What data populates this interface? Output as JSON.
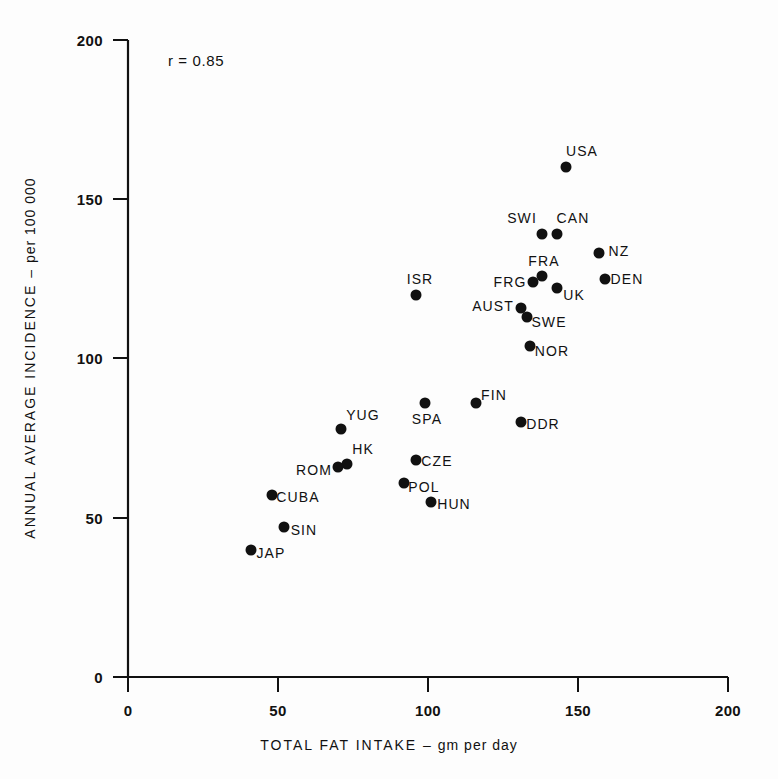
{
  "chart_data": {
    "type": "scatter",
    "title": "",
    "xlabel": "TOTAL FAT INTAKE",
    "xlabel_unit": "gm per day",
    "ylabel": "ANNUAL AVERAGE INCIDENCE",
    "ylabel_unit": "per 100 000",
    "xlim": [
      0,
      200
    ],
    "ylim": [
      0,
      200
    ],
    "xticks": [
      "0",
      "50",
      "100",
      "150",
      "200"
    ],
    "xtick_values": [
      0,
      50,
      100,
      150,
      200
    ],
    "yticks": [
      "0",
      "50",
      "100",
      "150",
      "200"
    ],
    "ytick_values": [
      0,
      50,
      100,
      150,
      200
    ],
    "grid": false,
    "legend": "none",
    "annotations": [
      {
        "text": "r = 0.85",
        "x": 14,
        "y": 193
      }
    ],
    "points": [
      {
        "label": "USA",
        "x": 146,
        "y": 160,
        "label_dx": 16,
        "label_dy": -16
      },
      {
        "label": "SWI",
        "x": 138,
        "y": 139,
        "label_dx": -20,
        "label_dy": -16
      },
      {
        "label": "CAN",
        "x": 143,
        "y": 139,
        "label_dx": 16,
        "label_dy": -16
      },
      {
        "label": "NZ",
        "x": 157,
        "y": 133,
        "label_dx": 20,
        "label_dy": -2
      },
      {
        "label": "FRA",
        "x": 138,
        "y": 126,
        "label_dx": 2,
        "label_dy": -15
      },
      {
        "label": "FRG",
        "x": 135,
        "y": 124,
        "label_dx": -23,
        "label_dy": 0
      },
      {
        "label": "UK",
        "x": 143,
        "y": 122,
        "label_dx": 17,
        "label_dy": 7
      },
      {
        "label": "DEN",
        "x": 159,
        "y": 125,
        "label_dx": 22,
        "label_dy": 0
      },
      {
        "label": "ISR",
        "x": 96,
        "y": 120,
        "label_dx": 4,
        "label_dy": -16
      },
      {
        "label": "AUST",
        "x": 131,
        "y": 116,
        "label_dx": -28,
        "label_dy": -2
      },
      {
        "label": "SWE",
        "x": 133,
        "y": 113,
        "label_dx": 22,
        "label_dy": 5
      },
      {
        "label": "NOR",
        "x": 134,
        "y": 104,
        "label_dx": 22,
        "label_dy": 5
      },
      {
        "label": "FIN",
        "x": 116,
        "y": 86,
        "label_dx": 18,
        "label_dy": -8
      },
      {
        "label": "SPA",
        "x": 99,
        "y": 86,
        "label_dx": 2,
        "label_dy": 16
      },
      {
        "label": "DDR",
        "x": 131,
        "y": 80,
        "label_dx": 22,
        "label_dy": 2
      },
      {
        "label": "YUG",
        "x": 71,
        "y": 78,
        "label_dx": 22,
        "label_dy": -14
      },
      {
        "label": "HK",
        "x": 73,
        "y": 67,
        "label_dx": 16,
        "label_dy": -15
      },
      {
        "label": "ROM",
        "x": 70,
        "y": 66,
        "label_dx": -24,
        "label_dy": 3
      },
      {
        "label": "CZE",
        "x": 96,
        "y": 68,
        "label_dx": 21,
        "label_dy": 1
      },
      {
        "label": "POL",
        "x": 92,
        "y": 61,
        "label_dx": 20,
        "label_dy": 4
      },
      {
        "label": "HUN",
        "x": 101,
        "y": 55,
        "label_dx": 23,
        "label_dy": 2
      },
      {
        "label": "CUBA",
        "x": 48,
        "y": 57,
        "label_dx": 26,
        "label_dy": 2
      },
      {
        "label": "SIN",
        "x": 52,
        "y": 47,
        "label_dx": 20,
        "label_dy": 3
      },
      {
        "label": "JAP",
        "x": 41,
        "y": 40,
        "label_dx": 20,
        "label_dy": 3
      }
    ]
  },
  "axes": {
    "x_title": "TOTAL FAT INTAKE",
    "x_dash": "–",
    "x_unit": "gm per day",
    "y_title": "ANNUAL AVERAGE INCIDENCE",
    "y_dash": "–",
    "y_unit": "per 100 000"
  },
  "annotation": {
    "correlation": "r = 0.85"
  }
}
